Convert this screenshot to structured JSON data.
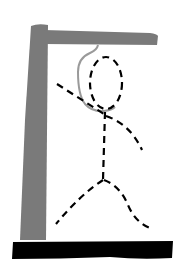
{
  "game": {
    "name": "Hangman",
    "state_label": "Hangman drawing - full figure",
    "parts_drawn": [
      "base",
      "post",
      "beam",
      "rope",
      "head",
      "body",
      "left-arm",
      "right-arm",
      "left-leg",
      "right-leg"
    ]
  },
  "colors": {
    "background": "#ffffff",
    "gallows": "#7a7a7a",
    "base": "#000000",
    "rope": "#9a9a9a",
    "figure": "#000000"
  }
}
